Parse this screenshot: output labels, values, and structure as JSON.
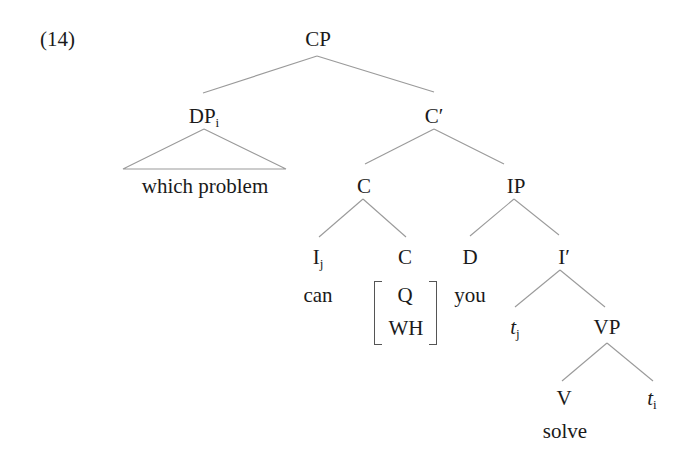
{
  "example": {
    "number": "(14)"
  },
  "tree": {
    "root": {
      "label": "CP"
    },
    "spec": {
      "label": "DP",
      "index": "i",
      "terminal": "which problem",
      "terminal_is_triangle": true
    },
    "cbar": {
      "label": "C′"
    },
    "c_complex": {
      "label": "C",
      "head_i": {
        "label": "I",
        "index": "j",
        "word": "can"
      },
      "head_c": {
        "label": "C",
        "features": [
          "Q",
          "WH"
        ]
      }
    },
    "ip": {
      "label": "IP",
      "subject": {
        "label": "D",
        "word": "you"
      },
      "ibar": {
        "label": "I′",
        "trace": {
          "label": "t",
          "index": "j"
        },
        "vp": {
          "label": "VP",
          "verb": {
            "label": "V",
            "word": "solve"
          },
          "object_trace": {
            "label": "t",
            "index": "i"
          }
        }
      }
    }
  },
  "colors": {
    "text": "#1a1a1a",
    "edges": "#9a9a9a",
    "background": "#ffffff"
  }
}
